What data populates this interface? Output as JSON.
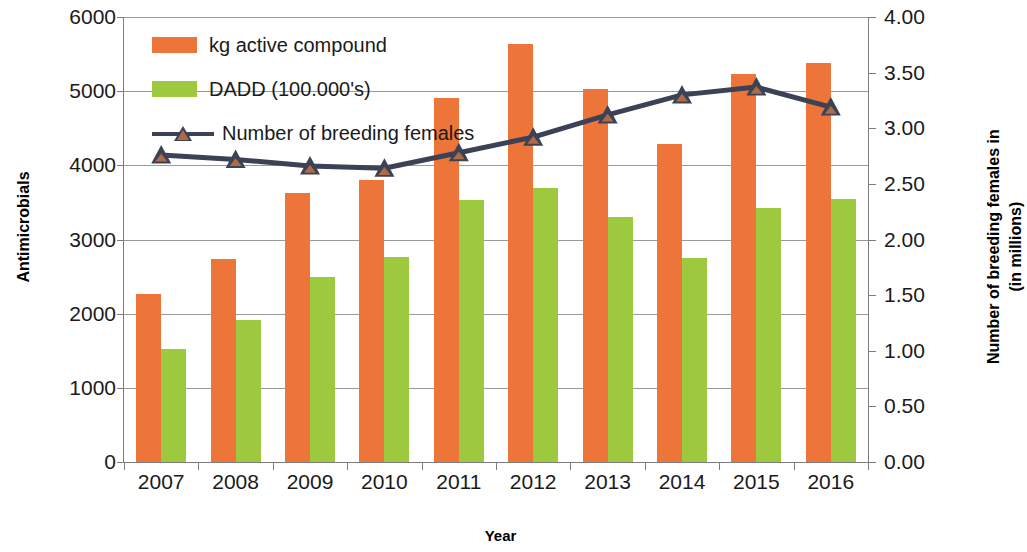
{
  "chart_data": {
    "type": "bar",
    "title": "",
    "xlabel": "Year",
    "ylabel": "Antimicrobials",
    "y2label": "Number of breeding females in (in millions)",
    "y2label_line1": "Number of breeding females in",
    "y2label_line2": "(in millions)",
    "categories": [
      "2007",
      "2008",
      "2009",
      "2010",
      "2011",
      "2012",
      "2013",
      "2014",
      "2015",
      "2016"
    ],
    "ylim": [
      0,
      6000
    ],
    "y2lim": [
      0,
      4.0
    ],
    "yticks": [
      "6000",
      "5000",
      "4000",
      "3000",
      "2000",
      "1000",
      "0"
    ],
    "ytick_values": [
      6000,
      5000,
      4000,
      3000,
      2000,
      1000,
      0
    ],
    "y2ticks": [
      "4.00",
      "3.50",
      "3.00",
      "2.50",
      "2.00",
      "1.50",
      "1.00",
      "0.50",
      "0.00"
    ],
    "y2tick_values": [
      4.0,
      3.5,
      3.0,
      2.5,
      2.0,
      1.5,
      1.0,
      0.5,
      0.0
    ],
    "grid": true,
    "legend_position": "top-left",
    "series": [
      {
        "name": "kg active compound",
        "kind": "bar",
        "axis": "left",
        "color": "#ee7539",
        "values": [
          2260,
          2740,
          3630,
          3800,
          4910,
          5640,
          5030,
          4290,
          5230,
          5380
        ]
      },
      {
        "name": "DADD (100.000's)",
        "kind": "bar",
        "axis": "left",
        "color": "#9cc93e",
        "values": [
          1520,
          1910,
          2490,
          2770,
          3530,
          3690,
          3300,
          2750,
          3430,
          3550
        ]
      },
      {
        "name": "Number of breeding females",
        "kind": "line",
        "axis": "right",
        "color": "#3b4256",
        "marker": "triangle",
        "marker_color": "#b06a46",
        "values": [
          2.76,
          2.72,
          2.66,
          2.64,
          2.78,
          2.92,
          3.12,
          3.3,
          3.37,
          3.19
        ]
      }
    ]
  },
  "legend": {
    "items": [
      {
        "label": "kg active compound",
        "type": "swatch-orange"
      },
      {
        "label": "DADD (100.000's)",
        "type": "swatch-green"
      },
      {
        "label": "Number of breeding females",
        "type": "line-marker"
      }
    ]
  },
  "colors": {
    "bar_kg": "#ee7539",
    "bar_dadd": "#9cc93e",
    "line": "#3b4256",
    "marker": "#b06a46",
    "grid": "#9a9a9a",
    "axis": "#7d7d7d",
    "text": "#1a1a1a",
    "background": "#ffffff"
  }
}
